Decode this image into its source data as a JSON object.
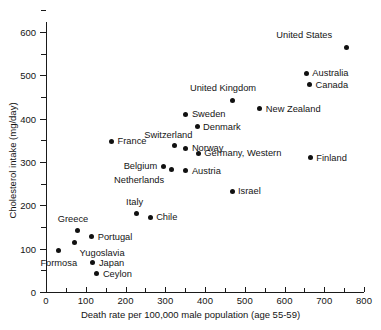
{
  "chart_data": {
    "type": "scatter",
    "title": "",
    "xlabel": "Death rate per 100,000 male population (age 55-59)",
    "ylabel": "Cholesterol intake (mg/day)",
    "xlim": [
      0,
      800
    ],
    "ylim": [
      0,
      650
    ],
    "xticks": [
      0,
      100,
      200,
      300,
      400,
      500,
      600,
      700,
      800
    ],
    "xtick_labels": [
      "0",
      "100",
      "200",
      "300",
      "400",
      "500",
      "600",
      "700",
      "800"
    ],
    "x_minor_ticks": [
      50,
      150,
      250,
      350,
      450,
      550,
      650,
      750
    ],
    "yticks": [
      0,
      100,
      200,
      300,
      400,
      500,
      600
    ],
    "ytick_labels": [
      "0",
      "100",
      "200",
      "300",
      "400",
      "500",
      "600"
    ],
    "y_minor_ticks": [
      50,
      150,
      250,
      350,
      450,
      550,
      650
    ],
    "grid": false,
    "legend": "none",
    "points": [
      {
        "label": "United States",
        "x": 755,
        "y": 565,
        "label_dx": -14,
        "label_dy": -17,
        "anchor": "end"
      },
      {
        "label": "Australia",
        "x": 655,
        "y": 505,
        "label_dx": 6,
        "label_dy": -5,
        "anchor": "start"
      },
      {
        "label": "Canada",
        "x": 663,
        "y": 478,
        "label_dx": 6,
        "label_dy": -5,
        "anchor": "start"
      },
      {
        "label": "United Kingdom",
        "x": 468,
        "y": 443,
        "label_dx": -9,
        "label_dy": -17,
        "anchor": "middle"
      },
      {
        "label": "New Zealand",
        "x": 538,
        "y": 423,
        "label_dx": 6,
        "label_dy": -5,
        "anchor": "start"
      },
      {
        "label": "Sweden",
        "x": 352,
        "y": 410,
        "label_dx": 6,
        "label_dy": -5,
        "anchor": "start"
      },
      {
        "label": "Denmark",
        "x": 380,
        "y": 381,
        "label_dx": 6,
        "label_dy": -5,
        "anchor": "start"
      },
      {
        "label": "France",
        "x": 165,
        "y": 348,
        "label_dx": 6,
        "label_dy": -5,
        "anchor": "start"
      },
      {
        "label": "Switzerland",
        "x": 323,
        "y": 338,
        "label_dx": -6,
        "label_dy": -16,
        "anchor": "middle"
      },
      {
        "label": "Norway",
        "x": 352,
        "y": 332,
        "label_dx": 6,
        "label_dy": -5,
        "anchor": "start"
      },
      {
        "label": "Germany, Western",
        "x": 383,
        "y": 320,
        "label_dx": 6,
        "label_dy": -5,
        "anchor": "start"
      },
      {
        "label": "Finland",
        "x": 665,
        "y": 310,
        "label_dx": 6,
        "label_dy": -5,
        "anchor": "start"
      },
      {
        "label": "Belgium",
        "x": 295,
        "y": 290,
        "label_dx": -6,
        "label_dy": -5,
        "anchor": "end"
      },
      {
        "label": "Netherlands",
        "x": 315,
        "y": 283,
        "label_dx": -7,
        "label_dy": 6,
        "anchor": "end"
      },
      {
        "label": "Austria",
        "x": 352,
        "y": 280,
        "label_dx": 6,
        "label_dy": -5,
        "anchor": "start"
      },
      {
        "label": "Israel",
        "x": 468,
        "y": 232,
        "label_dx": 6,
        "label_dy": -5,
        "anchor": "start"
      },
      {
        "label": "Italy",
        "x": 228,
        "y": 182,
        "label_dx": -2,
        "label_dy": -16,
        "anchor": "middle"
      },
      {
        "label": "Chile",
        "x": 262,
        "y": 172,
        "label_dx": 6,
        "label_dy": -5,
        "anchor": "start"
      },
      {
        "label": "Greece",
        "x": 78,
        "y": 142,
        "label_dx": -4,
        "label_dy": -16,
        "anchor": "middle"
      },
      {
        "label": "Portugal",
        "x": 115,
        "y": 127,
        "label_dx": 6,
        "label_dy": -5,
        "anchor": "start"
      },
      {
        "label": "Yugoslavia",
        "x": 72,
        "y": 115,
        "label_dx": 5,
        "label_dy": 6,
        "anchor": "start"
      },
      {
        "label": "Formosa",
        "x": 32,
        "y": 96,
        "label_dx": 0,
        "label_dy": 8,
        "anchor": "middle"
      },
      {
        "label": "Japan",
        "x": 118,
        "y": 68,
        "label_dx": 6,
        "label_dy": -5,
        "anchor": "start"
      },
      {
        "label": "Ceylon",
        "x": 128,
        "y": 42,
        "label_dx": 6,
        "label_dy": -5,
        "anchor": "start"
      }
    ]
  }
}
